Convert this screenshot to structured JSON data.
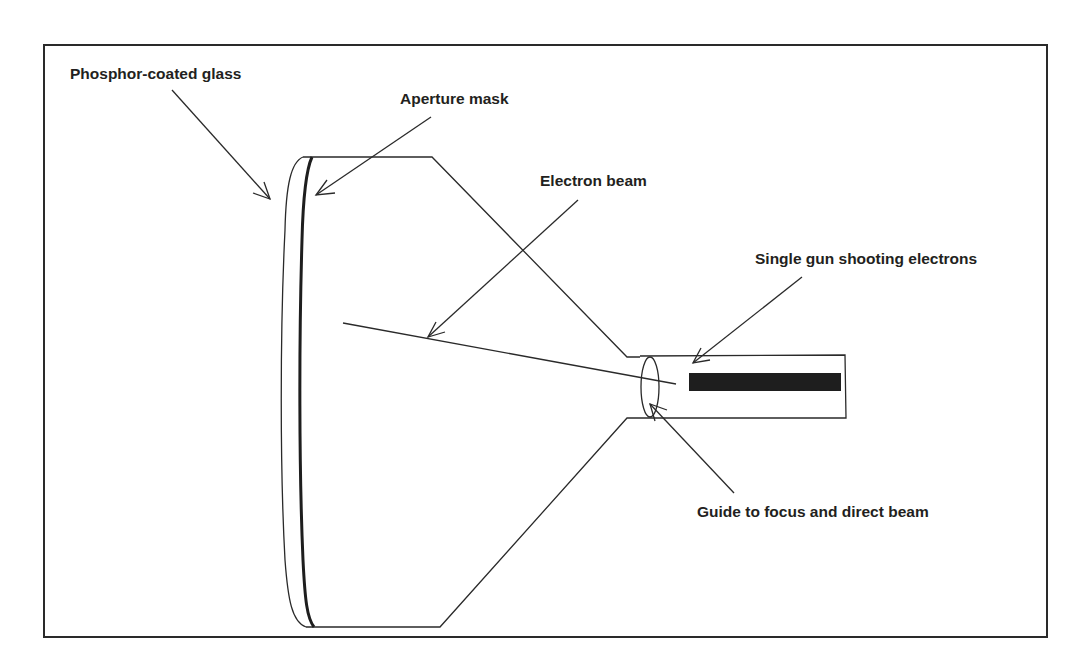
{
  "diagram": {
    "labels": {
      "phosphor_glass": "Phosphor-coated glass",
      "aperture_mask": "Aperture mask",
      "electron_beam": "Electron beam",
      "electron_gun": "Single gun shooting electrons",
      "guide": "Guide to focus and direct beam"
    },
    "colors": {
      "line": "#2a2a2a",
      "text": "#231f20",
      "gun_fill": "#1e1e1e",
      "background": "#ffffff"
    }
  }
}
